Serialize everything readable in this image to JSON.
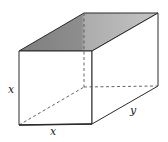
{
  "figure": {
    "type": "rectangular box (square prism) in oblique projection",
    "labels": {
      "height": "x",
      "width": "x",
      "depth": "y"
    },
    "colors": {
      "edge": "#2a2a2a",
      "hidden_edge": "#555555",
      "top_face_dark": "#8a8a8a",
      "top_face_light": "#bdbdbd",
      "side_face": "#ffffff"
    },
    "vertices": {
      "front_top_left": [
        19,
        51
      ],
      "front_top_right": [
        92,
        51
      ],
      "front_bottom_left": [
        19,
        125
      ],
      "front_bottom_right": [
        92,
        124
      ],
      "back_top_left": [
        84,
        13
      ],
      "back_top_right": [
        158,
        13
      ],
      "back_bottom_left": [
        84,
        87
      ],
      "back_bottom_right": [
        158,
        86
      ]
    }
  }
}
